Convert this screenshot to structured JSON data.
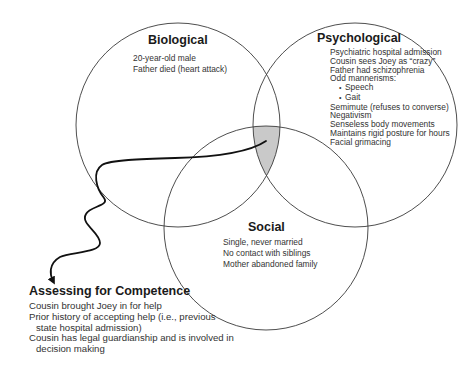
{
  "diagram": {
    "type": "venn",
    "circles": [
      {
        "id": "biological",
        "title": "Biological",
        "items": [
          "20-year-old male",
          "Father died (heart attack)"
        ]
      },
      {
        "id": "psychological",
        "title": "Psychological",
        "items": [
          "Psychiatric hospital admission",
          "Cousin sees Joey as “crazy”",
          "Father had schizophrenia",
          "Odd mannerisms:",
          "Speech",
          "Gait",
          "Semimute (refuses to converse)",
          "Negativism",
          "Senseless body movements",
          "Maintains rigid posture for hours",
          "Facial grimacing"
        ]
      },
      {
        "id": "social",
        "title": "Social",
        "items": [
          "Single, never married",
          "No contact with siblings",
          "Mother abandoned family"
        ]
      }
    ],
    "intersection": {
      "highlighted": "biological-psychological-social",
      "fill_color": "#c9c9c9"
    },
    "competence": {
      "title": "Assessing for Competence",
      "items": [
        "Cousin brought Joey in for help",
        "Prior history of accepting help (i.e., previous state hospital admission)",
        "Cousin has legal guardianship and is involved in decision making"
      ]
    },
    "colors": {
      "circle_stroke": "#3a3a3a",
      "arrow": "#111111",
      "text": "#333333"
    }
  }
}
